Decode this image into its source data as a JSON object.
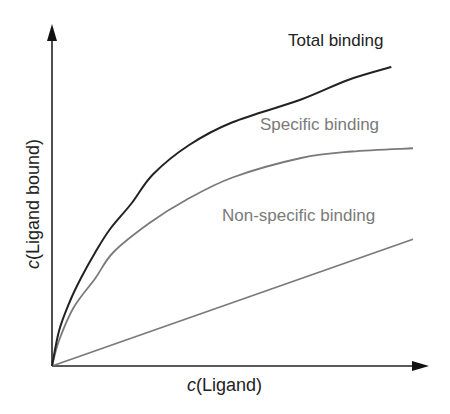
{
  "chart_data": {
    "type": "line",
    "title": "",
    "xlabel": "c(Ligand)",
    "ylabel": "c(Ligand bound)",
    "xlabel_parts": {
      "var": "c",
      "rest": "(Ligand)"
    },
    "ylabel_parts": {
      "var": "c",
      "rest": "(Ligand bound)"
    },
    "grid": false,
    "legend": "inline labels",
    "ticks": "none",
    "xlim": [
      0,
      1
    ],
    "ylim": [
      0,
      1
    ],
    "series": [
      {
        "name": "Total binding",
        "color": "#222222",
        "x": [
          0,
          0.02,
          0.05,
          0.08,
          0.12,
          0.16,
          0.22,
          0.28,
          0.38,
          0.5,
          0.69,
          0.82,
          0.94
        ],
        "y": [
          0,
          0.11,
          0.2,
          0.27,
          0.35,
          0.42,
          0.5,
          0.59,
          0.68,
          0.75,
          0.82,
          0.88,
          0.92
        ]
      },
      {
        "name": "Specific binding",
        "color": "#7a7a7a",
        "x": [
          0,
          0.02,
          0.06,
          0.12,
          0.17,
          0.27,
          0.37,
          0.5,
          0.69,
          0.83,
          1.0
        ],
        "y": [
          0,
          0.08,
          0.18,
          0.27,
          0.35,
          0.44,
          0.51,
          0.58,
          0.64,
          0.66,
          0.67
        ]
      },
      {
        "name": "Non-specific binding",
        "color": "#7a7a7a",
        "x": [
          0,
          1.0
        ],
        "y": [
          0,
          0.39
        ]
      }
    ]
  },
  "plot": {
    "origin_px": [
      52,
      366
    ],
    "x_end_px": 413,
    "y_end_px": 41,
    "axis_color": "#222222"
  },
  "labels": {
    "total": "Total binding",
    "specific": "Specific binding",
    "nonspecific": "Non-specific binding"
  }
}
